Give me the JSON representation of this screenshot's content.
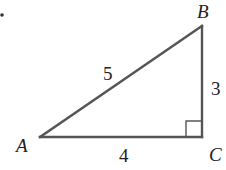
{
  "diagram": {
    "type": "right-triangle",
    "vertices": {
      "A": {
        "label": "A",
        "x": 40,
        "y": 137
      },
      "B": {
        "label": "B",
        "x": 202,
        "y": 26
      },
      "C": {
        "label": "C",
        "x": 202,
        "y": 137
      }
    },
    "sides": {
      "AB": {
        "label": "5"
      },
      "BC": {
        "label": "3"
      },
      "AC": {
        "label": "4"
      }
    },
    "right_angle_at": "C",
    "colors": {
      "stroke": "#555555",
      "text": "#222222"
    }
  }
}
